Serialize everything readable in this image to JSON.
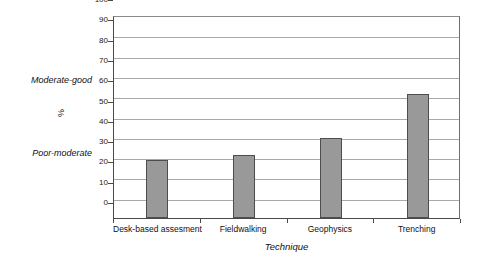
{
  "chart_data": {
    "type": "bar",
    "title": "",
    "subtitle": "",
    "categories": [
      "Desk-based assesment",
      "Fieldwalking",
      "Geophysics",
      "Trenching"
    ],
    "values": [
      28.5,
      31,
      39.5,
      61
    ],
    "xlabel": "Technique",
    "ylabel": "%",
    "ylim": [
      0,
      100
    ],
    "ytick_step": 10,
    "yticks": [
      0,
      10,
      20,
      30,
      40,
      50,
      60,
      70,
      80,
      90,
      100
    ],
    "ytick_labels": [
      "0",
      "10",
      "20",
      "30",
      "40",
      "50",
      "60",
      "70",
      "80",
      "90",
      "100"
    ],
    "grid": true,
    "grid_axis": "y",
    "legend": false,
    "legend_position": "none",
    "annotations": [
      {
        "text": "Moderate-good",
        "value": 70,
        "side": "left",
        "style": "italic"
      },
      {
        "text": "Poor-moderate",
        "value": 30,
        "side": "left",
        "style": "italic"
      }
    ],
    "colors": {
      "bar_fill": "#999999",
      "bar_border": "#4d4d4d",
      "gridline": "#a9a9a9",
      "axis": "#4a4a4a",
      "plot_background": "#ffffff",
      "text": "#111111"
    }
  }
}
